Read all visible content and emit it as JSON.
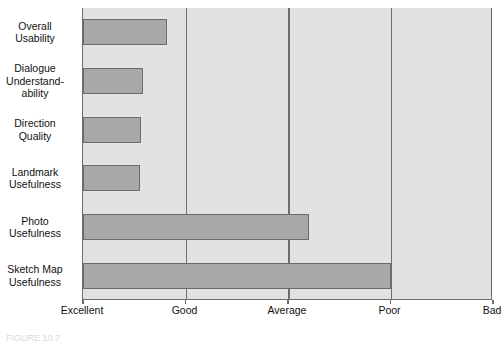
{
  "figure": {
    "caption": "FIGURE 10.7"
  },
  "chart_data": {
    "type": "bar",
    "orientation": "horizontal",
    "title": "",
    "xlabel": "",
    "ylabel": "",
    "grid": true,
    "legend": null,
    "x_tick_labels": [
      "Excellent",
      "Good",
      "Average",
      "Poor",
      "Bad"
    ],
    "x_tick_values": [
      1,
      2,
      3,
      4,
      5
    ],
    "xlim": [
      1,
      5
    ],
    "scale_note": "1 = Excellent (best) to 5 = Bad (worst); shorter bar is better",
    "categories": [
      "Overall Usability",
      "Dialogue Understand-ability",
      "Direction Quality",
      "Landmark Usefulness",
      "Photo Usefulness",
      "Sketch Map Usefulness"
    ],
    "values": [
      1.82,
      1.59,
      1.57,
      1.56,
      3.2,
      4.0
    ],
    "bars": [
      {
        "label_line1": "Overall",
        "label_line2": "Usability",
        "label_line3": "",
        "value": 1.82
      },
      {
        "label_line1": "Dialogue",
        "label_line2": "Understand-",
        "label_line3": "ability",
        "value": 1.59
      },
      {
        "label_line1": "Direction",
        "label_line2": "Quality",
        "label_line3": "",
        "value": 1.57
      },
      {
        "label_line1": "Landmark",
        "label_line2": "Usefulness",
        "label_line3": "",
        "value": 1.56
      },
      {
        "label_line1": "Photo",
        "label_line2": "Usefulness",
        "label_line3": "",
        "value": 3.2
      },
      {
        "label_line1": "Sketch Map",
        "label_line2": "Usefulness",
        "label_line3": "",
        "value": 4.0
      }
    ],
    "colors": {
      "bar_fill": "#a8a8a8",
      "bar_border": "#6b6b6b",
      "plot_background": "#e2e2e2",
      "axis": "#6e6e6e",
      "text": "#111111",
      "page_background": "#ffffff"
    }
  }
}
